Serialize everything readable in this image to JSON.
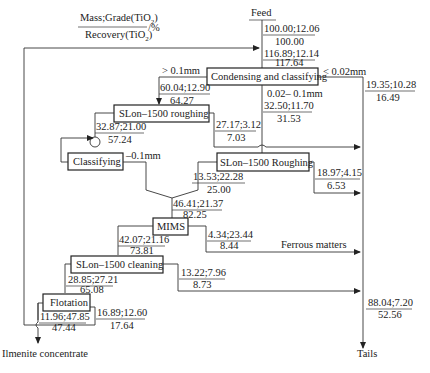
{
  "legend": {
    "numerator": "Mass;Grade(TiO",
    "numerator_sub": "2",
    "numerator_close": ")",
    "denominator": "Recovery(TiO",
    "denominator_sub": "2",
    "denominator_close": ")",
    "unit": "/%"
  },
  "nodes": {
    "feed": "Feed",
    "condensing": "Condensing and classifying",
    "slon_roughing_1": "SLon–1500 roughing",
    "classifying": "Classifying",
    "slon_roughing_2": "SLon–1500 Roughing",
    "mims": "MIMS",
    "slon_cleaning": "SLon–1500 cleaning",
    "flotation": "Flotation",
    "ilmenite": "Ilmenite concentrate",
    "tails": "Tails",
    "ferrous": "Ferrous matters"
  },
  "size_labels": {
    "gt_01": "> 0.1mm",
    "lt_002": "< 0.02mm",
    "mid": "0.02– 0.1mm",
    "minus_01": "–0.1mm"
  },
  "streams": {
    "feed": {
      "top": "100.00;12.06",
      "bottom": "100.00"
    },
    "combined_feed": {
      "top": "116.89;12.14",
      "bottom": "117.64"
    },
    "coarse": {
      "top": "60.04;12.90",
      "bottom": "64.27"
    },
    "slime": {
      "top": "19.35;10.28",
      "bottom": "16.49"
    },
    "middle": {
      "top": "32.50;11.70",
      "bottom": "31.53"
    },
    "rough1_tail": {
      "top": "27.17;3.12",
      "bottom": "7.03"
    },
    "rough1_conc": {
      "top": "32.87;21.00",
      "bottom": "57.24"
    },
    "rough2_tail": {
      "top": "18.97;4.15",
      "bottom": "6.53"
    },
    "rough2_conc": {
      "top": "13.53;22.28",
      "bottom": "25.00"
    },
    "mims_feed": {
      "top": "46.41;21.37",
      "bottom": "82.25"
    },
    "mims_mag": {
      "top": "4.34;23.44",
      "bottom": "8.44"
    },
    "mims_nonmag": {
      "top": "42.07;21.16",
      "bottom": "73.81"
    },
    "clean_tail": {
      "top": "13.22;7.96",
      "bottom": "8.73"
    },
    "clean_conc": {
      "top": "28.85;27.21",
      "bottom": "65.08"
    },
    "flot_conc": {
      "top": "11.96;47.85",
      "bottom": "47.44"
    },
    "flot_tail": {
      "top": "16.89;12.60",
      "bottom": "17.64"
    },
    "total_tails": {
      "top": "88.04;7.20",
      "bottom": "52.56"
    }
  }
}
